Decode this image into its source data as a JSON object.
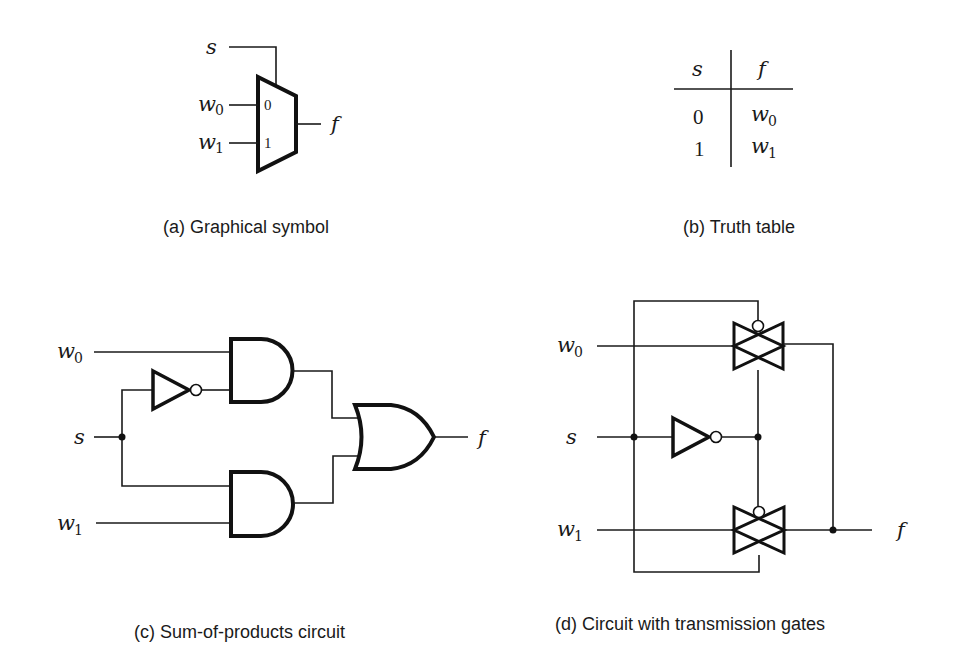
{
  "panels": {
    "a": {
      "caption": "(a) Graphical symbol",
      "labels": {
        "s": "s",
        "w0": "w",
        "w0_sub": "0",
        "w1": "w",
        "w1_sub": "1",
        "f": "f"
      },
      "mux_inputs": {
        "in0": "0",
        "in1": "1"
      }
    },
    "b": {
      "caption": "(b) Truth table",
      "table": {
        "headers": [
          "s",
          "f"
        ],
        "rows": [
          {
            "s": "0",
            "f": "w",
            "f_sub": "0"
          },
          {
            "s": "1",
            "f": "w",
            "f_sub": "1"
          }
        ]
      }
    },
    "c": {
      "caption": "(c) Sum-of-products circuit",
      "labels": {
        "w0": "w",
        "w0_sub": "0",
        "s": "s",
        "w1": "w",
        "w1_sub": "1",
        "f": "f"
      }
    },
    "d": {
      "caption": "(d) Circuit with transmission gates",
      "labels": {
        "w0": "w",
        "w0_sub": "0",
        "s": "s",
        "w1": "w",
        "w1_sub": "1",
        "f": "f"
      }
    }
  },
  "colors": {
    "ink": "#111111",
    "background": "#ffffff"
  }
}
